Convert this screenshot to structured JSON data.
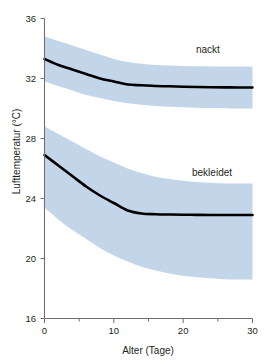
{
  "chart_data": {
    "type": "line",
    "title": "",
    "subtitle": "",
    "xlabel": "Alter (Tage)",
    "ylabel": "Lufttemperatur (°C)",
    "xlim": [
      0,
      30
    ],
    "ylim": [
      16,
      36
    ],
    "grid": false,
    "legend_position": "inline-right",
    "x_ticks": [
      0,
      10,
      20,
      30
    ],
    "x_tick_labels": [
      "0",
      "10",
      "20",
      "30"
    ],
    "x_minor_ticks": [
      5,
      15,
      25
    ],
    "y_ticks": [
      16,
      20,
      24,
      28,
      32,
      36
    ],
    "y_tick_labels": [
      "16",
      "20",
      "24",
      "28",
      "32",
      "36"
    ],
    "band_color": "#c3d5e8",
    "line_color": "#000000",
    "axis_color": "#6f6f6f",
    "x": [
      0,
      2,
      4,
      6,
      8,
      10,
      12,
      14,
      16,
      18,
      20,
      22,
      24,
      26,
      28,
      30
    ],
    "series": [
      {
        "name": "nackt",
        "label": "nackt",
        "values": [
          33.3,
          32.9,
          32.6,
          32.3,
          32.0,
          31.8,
          31.6,
          31.55,
          31.5,
          31.48,
          31.45,
          31.43,
          31.42,
          31.41,
          31.4,
          31.4
        ],
        "band_upper": [
          34.8,
          34.5,
          34.2,
          33.9,
          33.6,
          33.3,
          33.1,
          32.98,
          32.9,
          32.86,
          32.83,
          32.81,
          32.8,
          32.8,
          32.8,
          32.8
        ],
        "band_lower": [
          31.8,
          31.5,
          31.2,
          30.9,
          30.7,
          30.5,
          30.35,
          30.25,
          30.17,
          30.12,
          30.08,
          30.05,
          30.03,
          30.02,
          30.0,
          30.0
        ]
      },
      {
        "name": "bekleidet",
        "label": "bekleidet",
        "values": [
          26.9,
          26.2,
          25.5,
          24.8,
          24.2,
          23.7,
          23.2,
          23.0,
          22.95,
          22.93,
          22.92,
          22.91,
          22.9,
          22.9,
          22.9,
          22.9
        ],
        "band_upper": [
          28.8,
          28.3,
          27.8,
          27.3,
          26.8,
          26.4,
          26.0,
          25.7,
          25.45,
          25.3,
          25.18,
          25.1,
          25.05,
          25.0,
          25.0,
          25.0
        ],
        "band_lower": [
          23.4,
          22.6,
          21.9,
          21.3,
          20.7,
          20.2,
          19.8,
          19.45,
          19.2,
          19.0,
          18.85,
          18.75,
          18.68,
          18.62,
          18.6,
          18.6
        ]
      }
    ]
  },
  "axes": {
    "y_title": "Lufttemperatur (°C)",
    "x_title": "Alter (Tage)"
  },
  "labels": {
    "nackt": "nackt",
    "bekleidet": "bekleidet"
  }
}
